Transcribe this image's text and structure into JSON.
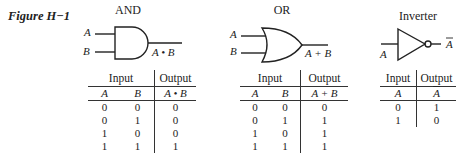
{
  "figure": {
    "label": "Figure H−1"
  },
  "gates": {
    "and": {
      "title": "AND",
      "input_a": "A",
      "input_b": "B",
      "output": "A • B",
      "table": {
        "group_input": "Input",
        "group_output": "Output",
        "columns": [
          "A",
          "B",
          "A • B"
        ],
        "rows": [
          [
            "0",
            "0",
            "0"
          ],
          [
            "0",
            "1",
            "0"
          ],
          [
            "1",
            "0",
            "0"
          ],
          [
            "1",
            "1",
            "1"
          ]
        ]
      }
    },
    "or": {
      "title": "OR",
      "input_a": "A",
      "input_b": "B",
      "output": "A + B",
      "table": {
        "group_input": "Input",
        "group_output": "Output",
        "columns": [
          "A",
          "B",
          "A + B"
        ],
        "rows": [
          [
            "0",
            "0",
            "0"
          ],
          [
            "0",
            "1",
            "1"
          ],
          [
            "1",
            "0",
            "1"
          ],
          [
            "1",
            "1",
            "1"
          ]
        ]
      }
    },
    "inverter": {
      "title": "Inverter",
      "input_a": "A",
      "output": "A",
      "table": {
        "group_input": "Input",
        "group_output": "Output",
        "columns": [
          "A",
          "A"
        ],
        "rows": [
          [
            "0",
            "1"
          ],
          [
            "1",
            "0"
          ]
        ]
      }
    }
  }
}
